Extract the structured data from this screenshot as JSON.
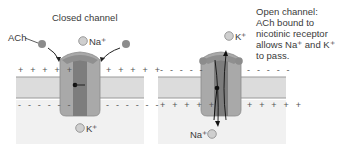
{
  "panels": {
    "closed": {
      "title": "Closed channel",
      "ach_label": "ACh",
      "ion_top": "Na⁺",
      "ion_bottom": "K⁺",
      "outside_charge": "+ + + + +",
      "inside_charge": "- - - - - -"
    },
    "open": {
      "caption_lines": [
        "Open channel:",
        "ACh bound to",
        "nicotinic receptor",
        "allows Na⁺ and K⁺",
        "to pass."
      ],
      "ion_top": "K⁺",
      "ion_bottom": "Na⁺",
      "outside_charge": "- - - - -",
      "inside_charge": "+ + + + +"
    }
  },
  "colors": {
    "extracellular": "#ffffff",
    "intracellular": "#f1f1f1",
    "membrane": "#dcdcdc",
    "membrane_edge": "#9a9a9a",
    "channel_outer": "#a9a9a9",
    "channel_inner": "#7d7d7d",
    "ach_ball": "#8c8c8c",
    "ion_ball": "#cfcfcf"
  }
}
